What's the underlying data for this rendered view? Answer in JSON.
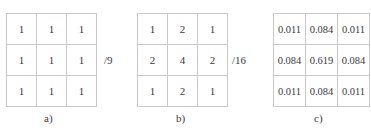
{
  "kernels": [
    {
      "id": "a",
      "caption": "a)",
      "divisor": "/9",
      "cells": [
        [
          "1",
          "1",
          "1"
        ],
        [
          "1",
          "1",
          "1"
        ],
        [
          "1",
          "1",
          "1"
        ]
      ]
    },
    {
      "id": "b",
      "caption": "b)",
      "divisor": "/16",
      "cells": [
        [
          "1",
          "2",
          "1"
        ],
        [
          "2",
          "4",
          "2"
        ],
        [
          "1",
          "2",
          "1"
        ]
      ]
    },
    {
      "id": "c",
      "caption": "c)",
      "divisor": "",
      "cells": [
        [
          "0.011",
          "0.084",
          "0.011"
        ],
        [
          "0.084",
          "0.619",
          "0.084"
        ],
        [
          "0.011",
          "0.084",
          "0.011"
        ]
      ]
    }
  ]
}
